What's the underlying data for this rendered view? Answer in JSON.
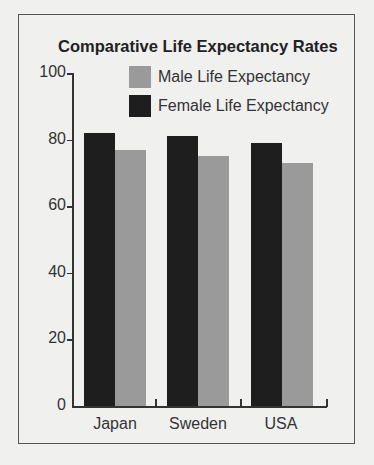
{
  "chart_data": {
    "type": "bar",
    "title": "Comparative Life Expectancy Rates",
    "xlabel": "",
    "ylabel": "",
    "ylim": [
      0,
      100
    ],
    "yticks": [
      0,
      20,
      40,
      60,
      80,
      100
    ],
    "categories": [
      "Japan",
      "Sweden",
      "USA"
    ],
    "series": [
      {
        "name": "Female Life Expectancy",
        "color": "#1e1e1e",
        "values": [
          82,
          81,
          79
        ]
      },
      {
        "name": "Male Life Expectancy",
        "color": "#9a9a9a",
        "values": [
          77,
          75,
          73
        ]
      }
    ],
    "legend": [
      {
        "label": "Male Life Expectancy",
        "color": "#9a9a9a"
      },
      {
        "label": "Female Life Expectancy",
        "color": "#1e1e1e"
      }
    ],
    "legend_position": "top-right",
    "grid": false
  }
}
